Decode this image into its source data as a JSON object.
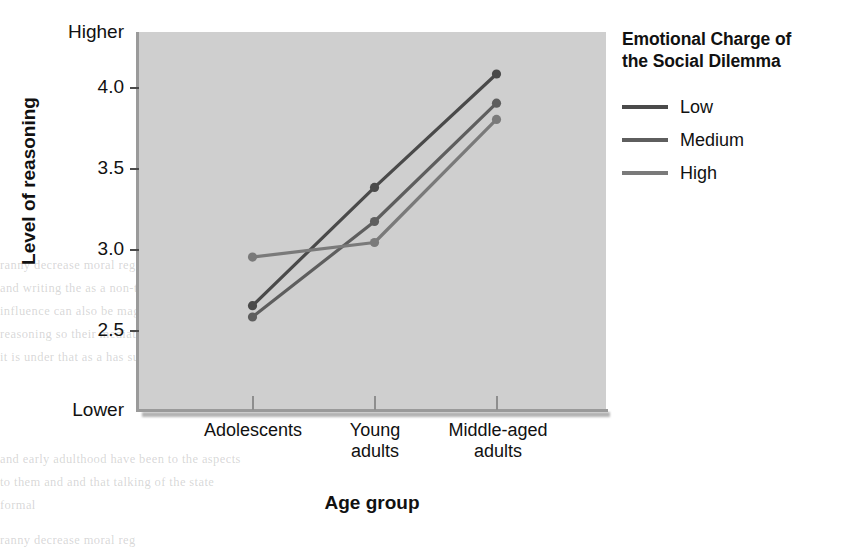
{
  "axes": {
    "y_title": "Level of reasoning",
    "y_top_label": "Higher",
    "y_bottom_label": "Lower",
    "y_ticks": [
      "4.0",
      "3.5",
      "3.0",
      "2.5"
    ],
    "x_title": "Age group",
    "x_labels": [
      "Adolescents",
      "Young\nadults",
      "Middle-aged\nadults"
    ]
  },
  "legend": {
    "title": "Emotional Charge of the Social Dilemma",
    "title_line1": "Emotional Charge of",
    "title_line2": "the Social Dilemma",
    "items": [
      {
        "label": "Low",
        "color": "#4a4a4a"
      },
      {
        "label": "Medium",
        "color": "#5e5e5e"
      },
      {
        "label": "High",
        "color": "#7a7a7a"
      }
    ]
  },
  "chart_data": {
    "type": "line",
    "title": "",
    "xlabel": "Age group",
    "ylabel": "Level of reasoning",
    "categories": [
      "Adolescents",
      "Young adults",
      "Middle-aged adults"
    ],
    "ylim": [
      2.0,
      4.35
    ],
    "ytick_values": [
      4.0,
      3.5,
      3.0,
      2.5
    ],
    "y_axis_endpoints": {
      "top": "Higher",
      "bottom": "Lower"
    },
    "grid": false,
    "legend_position": "right",
    "legend_title": "Emotional Charge of the Social Dilemma",
    "markers": "filled-circle",
    "series": [
      {
        "name": "Low",
        "color": "#4a4a4a",
        "values": [
          2.65,
          3.38,
          4.08
        ]
      },
      {
        "name": "Medium",
        "color": "#5e5e5e",
        "values": [
          2.58,
          3.17,
          3.9
        ]
      },
      {
        "name": "High",
        "color": "#7a7a7a",
        "values": [
          2.95,
          3.04,
          3.8
        ]
      }
    ]
  },
  "background_text": {
    "lines": [
      "ranny decrease moral reg",
      "and writing the   as a non-tested in men   approximately",
      "influence     can also be   magnitude   impression",
      "reasoning so their    mediates   of the relation",
      "it is   under that    as a   has support",
      "and early adulthood    have been   to the aspects",
      "to them and     and    that talking    of the state",
      "formal"
    ]
  }
}
